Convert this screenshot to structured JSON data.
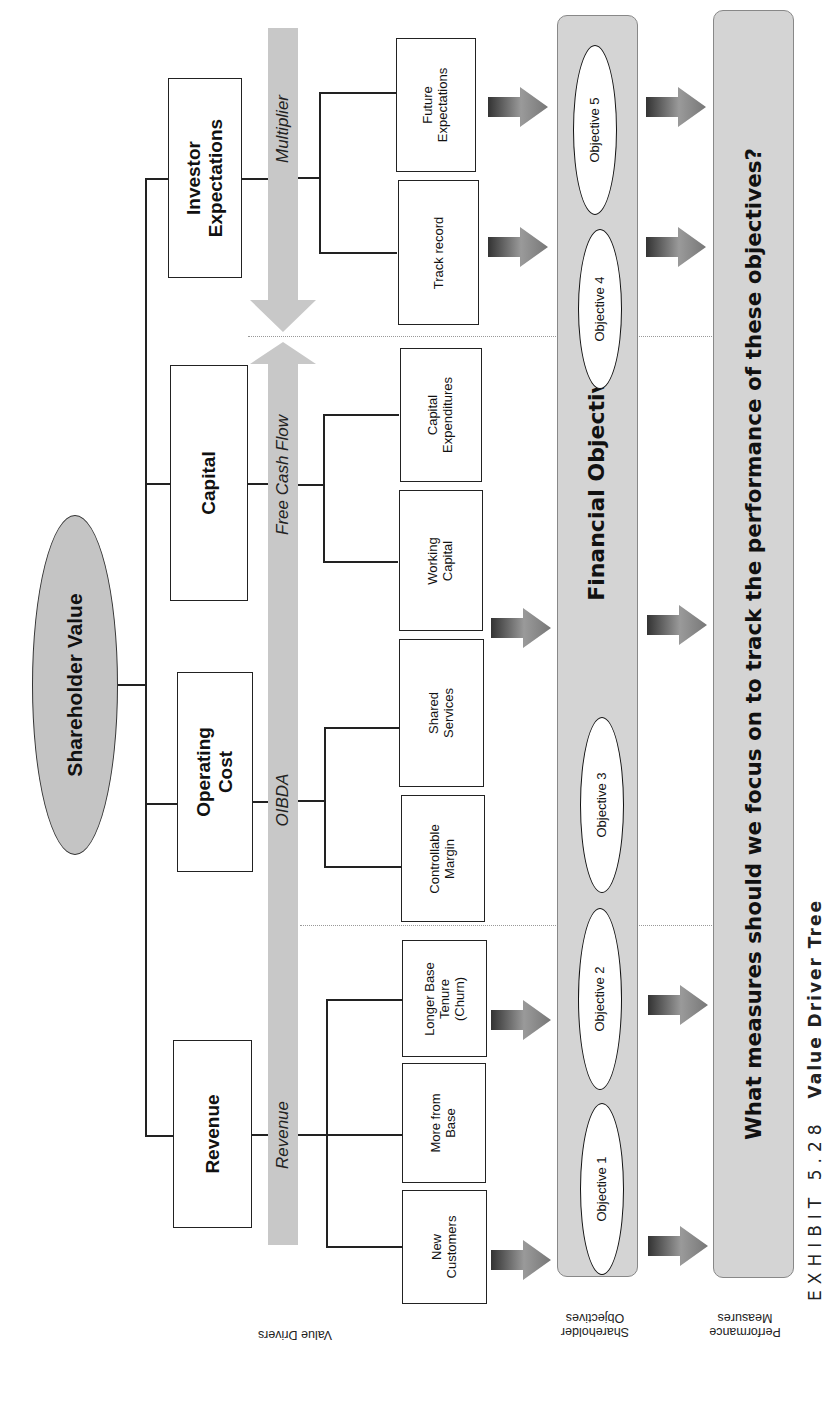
{
  "root": {
    "label": "Shareholder Value",
    "color": "#c4c4c4"
  },
  "level1": [
    {
      "id": "investor-expectations",
      "label_line1": "Investor",
      "label_line2": "Expectations"
    },
    {
      "id": "capital",
      "label_line1": "Capital",
      "label_line2": ""
    },
    {
      "id": "operating-cost",
      "label_line1": "Operating",
      "label_line2": "Cost"
    },
    {
      "id": "revenue",
      "label_line1": "Revenue",
      "label_line2": ""
    }
  ],
  "flow_band": {
    "multiplier": "Multiplier",
    "free_cash_flow": "Free Cash Flow",
    "oibda": "OIBDA",
    "revenue": "Revenue",
    "color": "#c8c8c8"
  },
  "level2": [
    {
      "id": "future-expectations",
      "lines": [
        "Future",
        "Expectations",
        ""
      ]
    },
    {
      "id": "track-record",
      "lines": [
        "Track record",
        "",
        ""
      ]
    },
    {
      "id": "capital-expenditures",
      "lines": [
        "Capital",
        "Expenditures",
        ""
      ]
    },
    {
      "id": "working-capital",
      "lines": [
        "Working",
        "Capital",
        ""
      ]
    },
    {
      "id": "shared-services",
      "lines": [
        "Shared",
        "Services",
        ""
      ]
    },
    {
      "id": "controllable-margin",
      "lines": [
        "Controllable",
        "Margin",
        ""
      ]
    },
    {
      "id": "longer-base-tenure",
      "lines": [
        "Longer Base",
        "Tenure",
        "(Churn)"
      ]
    },
    {
      "id": "more-from-base",
      "lines": [
        "More from",
        "Base",
        ""
      ]
    },
    {
      "id": "new-customers",
      "lines": [
        "New",
        "Customers",
        ""
      ]
    }
  ],
  "objectives": {
    "band_title": "Financial Objectives",
    "items": [
      "Objective 5",
      "Objective 4",
      "Objective 3",
      "Objective 2",
      "Objective 1"
    ]
  },
  "measures": {
    "question": "What measures should we focus on to track the performance of these objectives?"
  },
  "row_labels": {
    "value_drivers": "Value Drivers",
    "shareholder_objectives_line1": "Shareholder",
    "shareholder_objectives_line2": "Objectives",
    "performance_measures_line1": "Performance",
    "performance_measures_line2": "Measures"
  },
  "caption": {
    "exhibit": "EXHIBIT 5.28",
    "title": "Value Driver Tree"
  }
}
